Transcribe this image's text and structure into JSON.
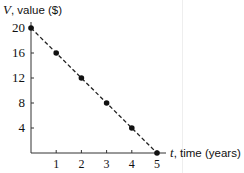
{
  "chart_data": {
    "type": "line",
    "title": "",
    "xlabel_var": "t",
    "xlabel_text": ", time (years)",
    "ylabel_var": "V",
    "ylabel_text": ", value ($)",
    "x": [
      0,
      1,
      2,
      3,
      4,
      5
    ],
    "series": [
      {
        "name": "V",
        "values": [
          20,
          16,
          12,
          8,
          4,
          0
        ],
        "style": "dashed",
        "markers": true
      }
    ],
    "x_ticks": [
      1,
      2,
      3,
      4,
      5
    ],
    "y_ticks": [
      4,
      8,
      12,
      16,
      20
    ],
    "xlim": [
      0,
      5
    ],
    "ylim": [
      0,
      20
    ],
    "grid": false,
    "line_color": "#222222"
  },
  "labels": {
    "y_ticks": [
      "20",
      "16",
      "12",
      "8",
      "4"
    ],
    "x_ticks": [
      "1",
      "2",
      "3",
      "4",
      "5"
    ]
  }
}
